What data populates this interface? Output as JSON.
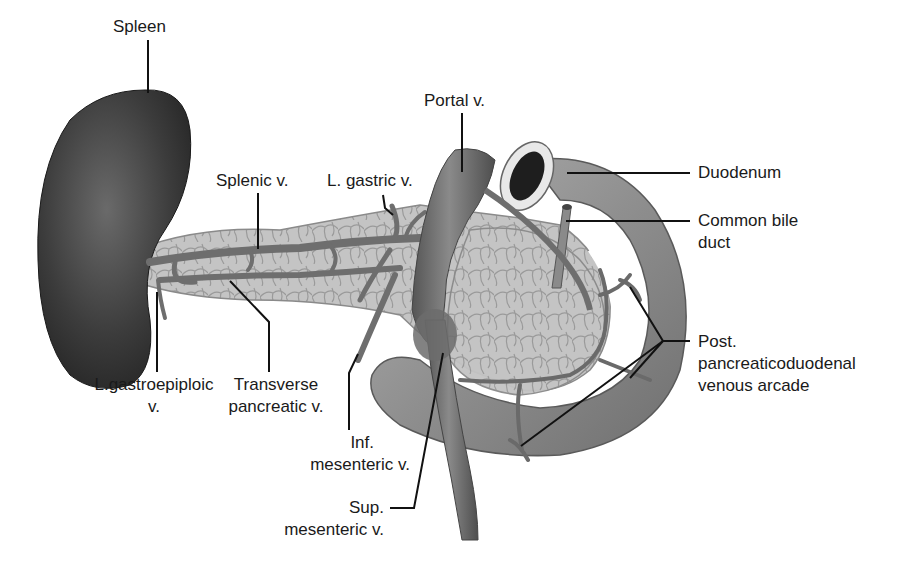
{
  "figure": {
    "colors": {
      "background": "#ffffff",
      "spleen": "#3a3a3a",
      "vein": "#6e6e6e",
      "pancreas": "#b8b8b8",
      "duodenum": "#8c8c8c",
      "leader_line": "#111111",
      "text": "#1a1a1a"
    }
  },
  "labels": {
    "spleen": {
      "line1": "Spleen"
    },
    "splenic_v": {
      "line1": "Splenic v."
    },
    "l_gastric_v": {
      "line1": "L. gastric v."
    },
    "portal_v": {
      "line1": "Portal v."
    },
    "duodenum": {
      "line1": "Duodenum"
    },
    "common_bile_duct": {
      "line1": "Common bile",
      "line2": "duct"
    },
    "post_pd_arcade": {
      "line1": "Post.",
      "line2": "pancreaticoduodenal",
      "line3": "venous arcade"
    },
    "l_gastroepiploic_v": {
      "line1": "L.gastroepiploic",
      "line2": "v."
    },
    "transverse_pancreatic_v": {
      "line1": "Transverse",
      "line2": "pancreatic v."
    },
    "inf_mesenteric_v": {
      "line1": "Inf.",
      "line2": "mesenteric v."
    },
    "sup_mesenteric_v": {
      "line1": "Sup.",
      "line2": "mesenteric v."
    }
  }
}
